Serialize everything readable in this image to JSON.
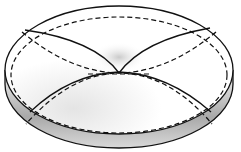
{
  "figure": {
    "colors": {
      "background": "#ffffff",
      "stroke": "#111111",
      "shade_dark": "#8a8a8a",
      "shade_light": "#e6e6e6"
    }
  }
}
